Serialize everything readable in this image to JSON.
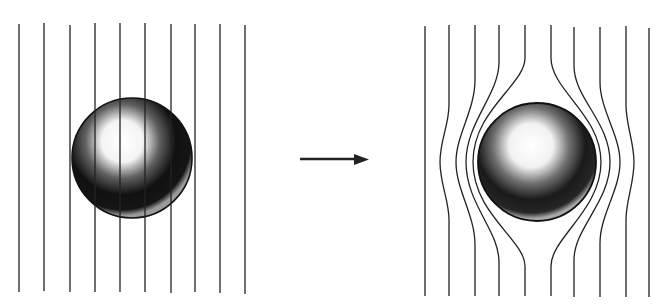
{
  "diagram": {
    "left_panel": {
      "state": "field-penetrates",
      "field_line_count": 10,
      "field_line_x": [
        19,
        44,
        70,
        95,
        120,
        145,
        171,
        195,
        220,
        245
      ],
      "sphere": {
        "cx": 132,
        "cy": 158,
        "r": 60
      }
    },
    "arrow": {
      "from_x": 300,
      "to_x": 368,
      "y": 159
    },
    "right_panel": {
      "state": "field-expelled",
      "field_line_count": 10,
      "sphere": {
        "cx": 537,
        "cy": 162,
        "r": 59
      }
    },
    "colors": {
      "line": "#1a1a1a",
      "background": "#ffffff"
    }
  }
}
